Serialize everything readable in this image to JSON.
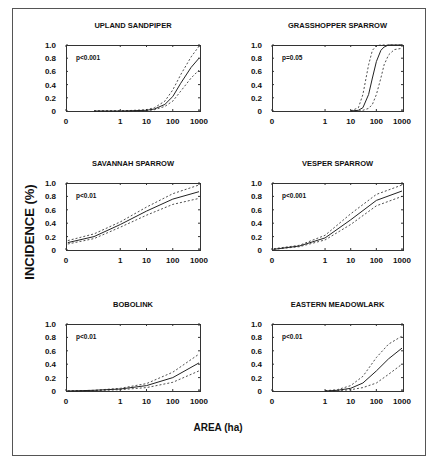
{
  "figure": {
    "ylabel": "INCIDENCE (%)",
    "xlabel": "AREA (ha)"
  },
  "chart_data": [
    {
      "type": "line",
      "title": "UPLAND SANDPIPER",
      "annotation": "p<0.001",
      "xlabel": "AREA (ha)",
      "ylabel": "INCIDENCE (%)",
      "x_scale": "log",
      "x_ticks": [
        "0",
        "1",
        "10",
        "100",
        "1000"
      ],
      "y_ticks": [
        "0",
        "0.2",
        "0.4",
        "0.6",
        "0.8",
        "1.0"
      ],
      "ylim": [
        0,
        1.0
      ],
      "grid": false,
      "x": [
        0.1,
        1,
        10,
        20,
        50,
        100,
        200,
        500,
        1000
      ],
      "series": [
        {
          "name": "fitted",
          "style": "solid",
          "values": [
            0.0,
            0.0,
            0.01,
            0.03,
            0.1,
            0.22,
            0.42,
            0.66,
            0.8
          ]
        },
        {
          "name": "upper CI",
          "style": "dashed",
          "values": [
            0.0,
            0.0,
            0.02,
            0.05,
            0.15,
            0.32,
            0.55,
            0.82,
            0.98
          ]
        },
        {
          "name": "lower CI",
          "style": "dashed",
          "values": [
            0.0,
            0.0,
            0.005,
            0.02,
            0.07,
            0.15,
            0.3,
            0.5,
            0.62
          ]
        }
      ]
    },
    {
      "type": "line",
      "title": "GRASSHOPPER SPARROW",
      "annotation": "p=0.05",
      "xlabel": "AREA (ha)",
      "ylabel": "INCIDENCE (%)",
      "x_scale": "log",
      "x_ticks": [
        "0",
        "1",
        "10",
        "100",
        "1000"
      ],
      "y_ticks": [
        "0",
        "0.2",
        "0.4",
        "0.6",
        "0.8",
        "1.0"
      ],
      "ylim": [
        0,
        1.0
      ],
      "grid": false,
      "x": [
        10,
        20,
        30,
        50,
        70,
        100,
        150,
        200,
        300,
        500,
        1000
      ],
      "series": [
        {
          "name": "fitted",
          "style": "solid",
          "values": [
            0.0,
            0.01,
            0.05,
            0.25,
            0.5,
            0.75,
            0.92,
            0.97,
            1.0,
            1.0,
            1.0
          ]
        },
        {
          "name": "upper CI",
          "style": "dashed",
          "values": [
            0.0,
            0.05,
            0.25,
            0.7,
            0.92,
            0.99,
            1.0,
            1.0,
            1.0,
            1.0,
            1.0
          ]
        },
        {
          "name": "lower CI",
          "style": "dashed",
          "values": [
            0.0,
            0.0,
            0.01,
            0.04,
            0.1,
            0.25,
            0.5,
            0.7,
            0.85,
            0.93,
            0.95
          ]
        }
      ]
    },
    {
      "type": "line",
      "title": "SAVANNAH SPARROW",
      "annotation": "p<0.01",
      "xlabel": "AREA (ha)",
      "ylabel": "INCIDENCE (%)",
      "x_scale": "log",
      "x_ticks": [
        "0",
        "1",
        "10",
        "100",
        "1000"
      ],
      "y_ticks": [
        "0",
        "0.2",
        "0.4",
        "0.6",
        "0.8",
        "1.0"
      ],
      "ylim": [
        0,
        1.0
      ],
      "grid": false,
      "x": [
        0.01,
        0.1,
        1,
        10,
        100,
        1000
      ],
      "series": [
        {
          "name": "fitted",
          "style": "solid",
          "values": [
            0.11,
            0.2,
            0.38,
            0.58,
            0.76,
            0.87
          ]
        },
        {
          "name": "upper CI",
          "style": "dashed",
          "values": [
            0.14,
            0.24,
            0.42,
            0.64,
            0.84,
            0.97
          ]
        },
        {
          "name": "lower CI",
          "style": "dashed",
          "values": [
            0.09,
            0.17,
            0.34,
            0.52,
            0.68,
            0.77
          ]
        }
      ]
    },
    {
      "type": "line",
      "title": "VESPER SPARROW",
      "annotation": "p<0.001",
      "xlabel": "AREA (ha)",
      "ylabel": "INCIDENCE (%)",
      "x_scale": "log",
      "x_ticks": [
        "0",
        "1",
        "10",
        "100",
        "1000"
      ],
      "y_ticks": [
        "0",
        "0.2",
        "0.4",
        "0.6",
        "0.8",
        "1.0"
      ],
      "ylim": [
        0,
        1.0
      ],
      "grid": false,
      "x": [
        0.01,
        0.1,
        1,
        10,
        100,
        1000
      ],
      "series": [
        {
          "name": "fitted",
          "style": "solid",
          "values": [
            0.01,
            0.06,
            0.18,
            0.45,
            0.74,
            0.88
          ]
        },
        {
          "name": "upper CI",
          "style": "dashed",
          "values": [
            0.02,
            0.07,
            0.22,
            0.54,
            0.83,
            0.97
          ]
        },
        {
          "name": "lower CI",
          "style": "dashed",
          "values": [
            0.01,
            0.05,
            0.15,
            0.38,
            0.66,
            0.8
          ]
        }
      ]
    },
    {
      "type": "line",
      "title": "BOBOLINK",
      "annotation": "p<0.01",
      "xlabel": "AREA (ha)",
      "ylabel": "INCIDENCE (%)",
      "x_scale": "log",
      "x_ticks": [
        "0",
        "1",
        "10",
        "100",
        "1000"
      ],
      "y_ticks": [
        "0",
        "0.2",
        "0.4",
        "0.6",
        "0.8",
        "1.0"
      ],
      "ylim": [
        0,
        1.0
      ],
      "grid": false,
      "x": [
        0.01,
        0.1,
        1,
        10,
        100,
        1000
      ],
      "series": [
        {
          "name": "fitted",
          "style": "solid",
          "values": [
            0.0,
            0.01,
            0.03,
            0.08,
            0.2,
            0.42
          ]
        },
        {
          "name": "upper CI",
          "style": "dashed",
          "values": [
            0.0,
            0.01,
            0.04,
            0.11,
            0.28,
            0.55
          ]
        },
        {
          "name": "lower CI",
          "style": "dashed",
          "values": [
            0.0,
            0.005,
            0.02,
            0.05,
            0.13,
            0.3
          ]
        }
      ]
    },
    {
      "type": "line",
      "title": "EASTERN MEADOWLARK",
      "annotation": "p<0.01",
      "xlabel": "AREA (ha)",
      "ylabel": "INCIDENCE (%)",
      "x_scale": "log",
      "x_ticks": [
        "0",
        "1",
        "10",
        "100",
        "1000"
      ],
      "y_ticks": [
        "0",
        "0.2",
        "0.4",
        "0.6",
        "0.8",
        "1.0"
      ],
      "ylim": [
        0,
        1.0
      ],
      "grid": false,
      "x": [
        1,
        3,
        10,
        30,
        100,
        300,
        1000
      ],
      "series": [
        {
          "name": "fitted",
          "style": "solid",
          "values": [
            0.0,
            0.01,
            0.04,
            0.12,
            0.3,
            0.48,
            0.64
          ]
        },
        {
          "name": "upper CI",
          "style": "dashed",
          "values": [
            0.005,
            0.02,
            0.08,
            0.22,
            0.5,
            0.7,
            0.82
          ]
        },
        {
          "name": "lower CI",
          "style": "dashed",
          "values": [
            0.0,
            0.005,
            0.02,
            0.05,
            0.12,
            0.25,
            0.4
          ]
        }
      ]
    }
  ]
}
